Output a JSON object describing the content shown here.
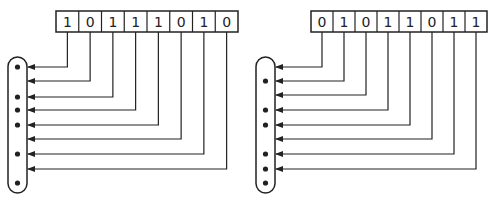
{
  "diagrams": [
    {
      "name": "left",
      "bits": [
        "1",
        "0",
        "1",
        "1",
        "1",
        "0",
        "1",
        "0"
      ],
      "dots": [
        true,
        false,
        true,
        true,
        true,
        false,
        true,
        false
      ],
      "extra_bottom_dot": true,
      "register": {
        "x": 56,
        "y": 11,
        "w": 182,
        "h": 21
      },
      "capsule": {
        "x": 8,
        "y": 57,
        "w": 19,
        "h": 136
      },
      "arrow_y": [
        67,
        81,
        97,
        110,
        125,
        139,
        154,
        169
      ]
    },
    {
      "name": "right",
      "bits": [
        "0",
        "1",
        "0",
        "1",
        "1",
        "0",
        "1",
        "1"
      ],
      "dots": [
        false,
        true,
        false,
        true,
        true,
        false,
        true,
        true
      ],
      "extra_bottom_dot": true,
      "register": {
        "x": 311,
        "y": 11,
        "w": 176,
        "h": 21
      },
      "capsule": {
        "x": 256,
        "y": 57,
        "w": 19,
        "h": 136
      },
      "arrow_y": [
        67,
        81,
        95,
        110,
        125,
        139,
        154,
        169
      ]
    }
  ],
  "colors": {
    "line": "#222222",
    "background": "#ffffff"
  }
}
